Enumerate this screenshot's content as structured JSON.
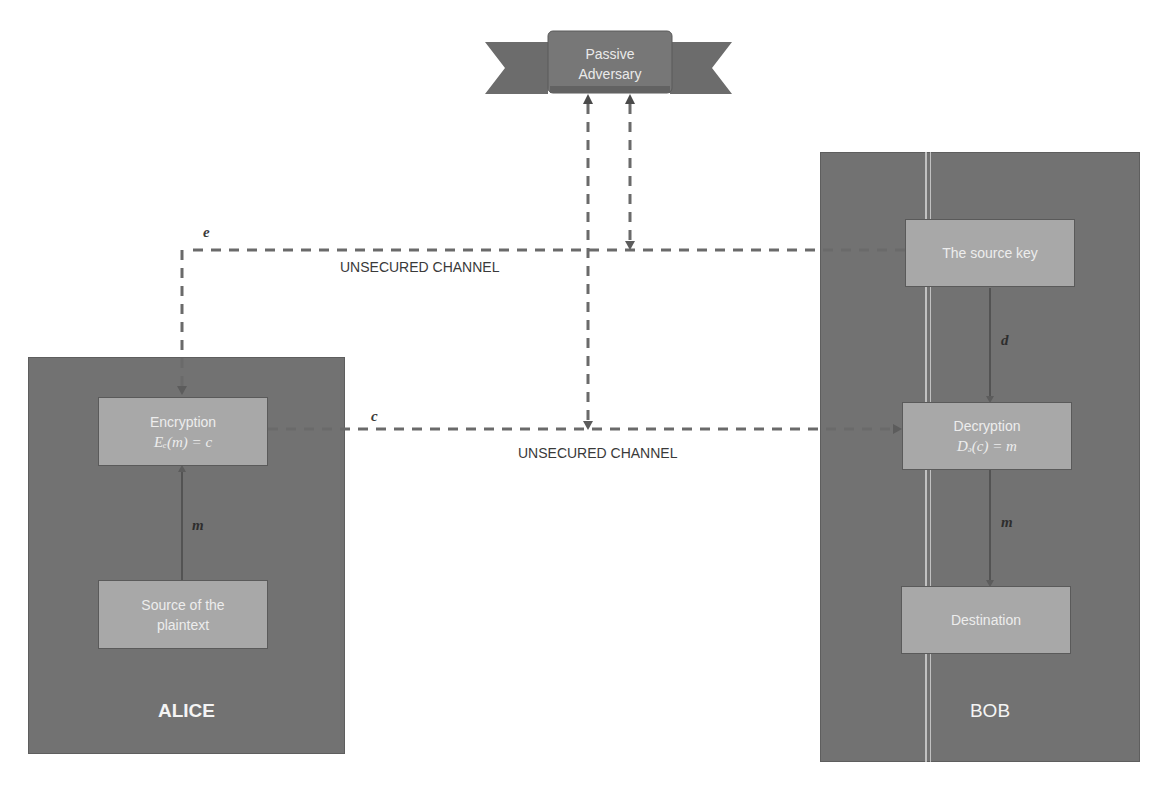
{
  "adversary": {
    "line1": "Passive",
    "line2": "Adversary"
  },
  "alice": {
    "label": "ALICE",
    "encryption": {
      "title": "Encryption",
      "formula": "Eₑ(m) = c"
    },
    "source": {
      "line1": "Source of the",
      "line2": "plaintext"
    },
    "edge_m": "m"
  },
  "bob": {
    "label": "BOB",
    "source_key": {
      "title": "The source key"
    },
    "decryption": {
      "title": "Decryption",
      "formula": "Dₔ(c) = m"
    },
    "destination": {
      "title": "Destination"
    },
    "edge_d": "d",
    "edge_m": "m"
  },
  "channels": {
    "key_channel": {
      "label": "UNSECURED CHANNEL",
      "var": "e"
    },
    "cipher_channel": {
      "label": "UNSECURED CHANNEL",
      "var": "c"
    }
  },
  "colors": {
    "party_box": "#727272",
    "node_box": "#a8a8a8",
    "dash_line": "#6a6a6a",
    "banner": "#767676"
  }
}
